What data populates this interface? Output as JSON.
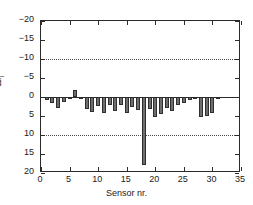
{
  "chart_data": {
    "type": "bar",
    "title": "",
    "xlabel": "Sensor nr.",
    "ylabel": "Δf",
    "ylabel_sub": "i",
    "xlim": [
      0,
      35
    ],
    "ylim": [
      -20,
      20
    ],
    "xticks": [
      0,
      5,
      10,
      15,
      20,
      25,
      30,
      35
    ],
    "yticks": [
      -20,
      -15,
      -10,
      -5,
      0,
      5,
      10,
      15,
      20
    ],
    "xtick_labels": [
      "0",
      "5",
      "10",
      "15",
      "20",
      "25",
      "30",
      "35"
    ],
    "ytick_labels": [
      "20",
      "15",
      "10",
      "5",
      "0",
      "−5",
      "−10",
      "−15",
      "−20"
    ],
    "grid": "horizontal-dotted-at-10-and-minus-10",
    "gridlines": [
      10,
      -10
    ],
    "zero_line": 0,
    "legend": null,
    "bar_color": "#6e6e6e",
    "bar_edge_color": "#2f2f2f",
    "categories": [
      1,
      2,
      3,
      4,
      5,
      6,
      7,
      8,
      9,
      10,
      11,
      12,
      13,
      14,
      15,
      16,
      17,
      18,
      19,
      20,
      21,
      22,
      23,
      24,
      25,
      26,
      27,
      28,
      29,
      30,
      31
    ],
    "values": [
      -0.8,
      -1.6,
      -3.0,
      -1.2,
      -0.3,
      1.8,
      -0.6,
      -3.2,
      -4.0,
      -2.3,
      -4.3,
      -2.0,
      -3.6,
      -2.2,
      -4.2,
      -2.6,
      -3.5,
      -18.0,
      -3.2,
      -5.3,
      -4.6,
      -3.0,
      -3.6,
      -2.2,
      -1.6,
      -0.8,
      -0.3,
      -5.3,
      -5.0,
      -4.3,
      -0.2
    ]
  },
  "axes": {
    "frame_color": "#2b2b2b"
  }
}
